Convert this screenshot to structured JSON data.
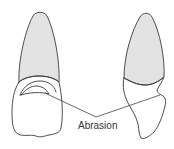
{
  "diagram": {
    "label": "Abrasion",
    "colors": {
      "background": "#ffffff",
      "outline": "#3a3a3a",
      "root_fill": "#e3e3e3",
      "text": "#333333"
    },
    "figures": [
      {
        "name": "left-tooth",
        "view": "facial",
        "abrasion_marked": true
      },
      {
        "name": "right-tooth",
        "view": "proximal",
        "abrasion_marked": true
      }
    ]
  }
}
